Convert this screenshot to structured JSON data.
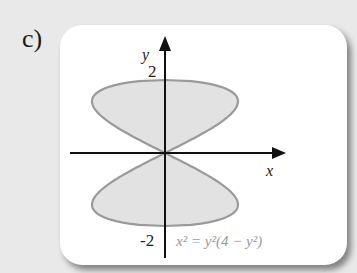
{
  "part_label": "c)",
  "axes": {
    "x_label": "x",
    "y_label": "y",
    "y_tick_top": "2",
    "y_tick_bottom": "-2"
  },
  "equation": "x² = y²(4 − y²)",
  "colors": {
    "fill": "#e2e2e2",
    "outline": "#9a9a9a",
    "axis": "#111111",
    "equation_text": "#9a9a9a"
  },
  "chart_data": {
    "type": "region",
    "title": "",
    "curve": "x^2 = y^2(4 - y^2)",
    "xlabel": "x",
    "ylabel": "y",
    "ylim": [
      -2,
      2
    ],
    "xlim": [
      -2,
      2
    ],
    "y_ticks": [
      2,
      -2
    ],
    "shaded": "interior of the curve (two lobes, touching at origin)"
  }
}
